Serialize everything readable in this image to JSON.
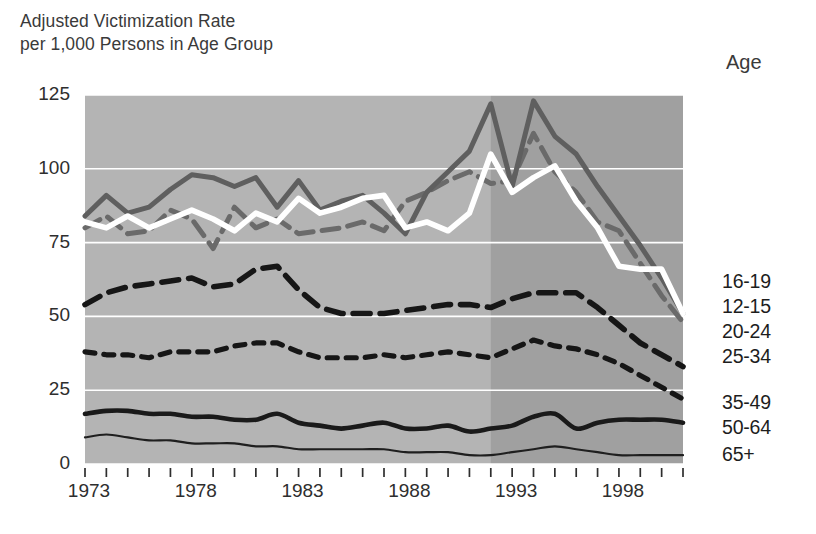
{
  "chart_data": {
    "type": "line",
    "title": "Adjusted Victimization Rate\nper 1,000 Persons in Age Group",
    "legend_title": "Age",
    "legend_position": "right",
    "xlabel": "",
    "ylabel": "Adjusted Victimization Rate per 1,000 Persons in Age Group",
    "ylim": [
      0,
      125
    ],
    "yticks": [
      0,
      25,
      50,
      75,
      100,
      125
    ],
    "ytick_labels": [
      "0",
      "25",
      "50",
      "75",
      "100",
      "125"
    ],
    "xlim": [
      1973,
      2001
    ],
    "xticks": [
      1973,
      1978,
      1983,
      1988,
      1993,
      1998
    ],
    "xtick_labels": [
      "1973",
      "1978",
      "1983",
      "1988",
      "1993",
      "1998"
    ],
    "x": [
      1973,
      1974,
      1975,
      1976,
      1977,
      1978,
      1979,
      1980,
      1981,
      1982,
      1983,
      1984,
      1985,
      1986,
      1987,
      1988,
      1989,
      1990,
      1991,
      1992,
      1993,
      1994,
      1995,
      1996,
      1997,
      1998,
      1999,
      2000,
      2001
    ],
    "grid": "horizontal gridlines in white, plot background shaded gray; darker gray band from 1992 to 2001",
    "plot_bg": "#b4b4b4",
    "plot_bg_dark": "#a0a0a0",
    "gridline_color": "#ffffff",
    "shade_break_year": 1992,
    "series": [
      {
        "name": "16-19",
        "color": "#5f5f5f",
        "style": "solid-thick",
        "values": [
          84,
          91,
          85,
          87,
          93,
          98,
          97,
          94,
          97,
          87,
          96,
          86,
          89,
          91,
          85,
          78,
          92,
          99,
          106,
          122,
          94,
          123,
          111,
          105,
          94,
          84,
          74,
          63,
          51
        ]
      },
      {
        "name": "12-15",
        "color": "#ffffff",
        "style": "solid-thick-white",
        "values": [
          82,
          80,
          84,
          80,
          83,
          86,
          83,
          79,
          85,
          82,
          90,
          85,
          87,
          90,
          91,
          80,
          82,
          79,
          85,
          105,
          92,
          97,
          101,
          89,
          80,
          67,
          66,
          66,
          51
        ]
      },
      {
        "name": "20-24",
        "color": "#6a6a6a",
        "style": "long-dash-gray",
        "values": [
          80,
          84,
          78,
          79,
          86,
          83,
          73,
          87,
          80,
          83,
          78,
          79,
          80,
          82,
          79,
          89,
          92,
          96,
          99,
          95,
          96,
          112,
          99,
          92,
          82,
          79,
          68,
          57,
          48
        ]
      },
      {
        "name": "25-34",
        "color": "#161616",
        "style": "long-dash-black",
        "values": [
          54,
          58,
          60,
          61,
          62,
          63,
          60,
          61,
          66,
          67,
          59,
          53,
          51,
          51,
          51,
          52,
          53,
          54,
          54,
          53,
          56,
          58,
          58,
          58,
          53,
          47,
          41,
          37,
          33
        ]
      },
      {
        "name": "35-49",
        "color": "#161616",
        "style": "short-dash-black",
        "values": [
          38,
          37,
          37,
          36,
          38,
          38,
          38,
          40,
          41,
          41,
          38,
          36,
          36,
          36,
          37,
          36,
          37,
          38,
          37,
          36,
          39,
          42,
          40,
          39,
          37,
          34,
          30,
          26,
          22
        ]
      },
      {
        "name": "50-64",
        "color": "#1a1a1a",
        "style": "solid-medium",
        "values": [
          17,
          18,
          18,
          17,
          17,
          16,
          16,
          15,
          15,
          17,
          14,
          13,
          12,
          13,
          14,
          12,
          12,
          13,
          11,
          12,
          13,
          16,
          17,
          12,
          14,
          15,
          15,
          15,
          14
        ]
      },
      {
        "name": "65+",
        "color": "#1f1f1f",
        "style": "solid-thin",
        "values": [
          9,
          10,
          9,
          8,
          8,
          7,
          7,
          7,
          6,
          6,
          5,
          5,
          5,
          5,
          5,
          4,
          4,
          4,
          3,
          3,
          4,
          5,
          6,
          5,
          4,
          3,
          3,
          3,
          3
        ]
      }
    ],
    "legend_entries": [
      "16-19",
      "12-15",
      "20-24",
      "25-34",
      "35-49",
      "50-64",
      "65+"
    ]
  }
}
